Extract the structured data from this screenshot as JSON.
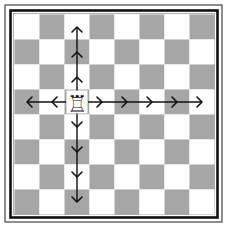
{
  "diagram": {
    "board": {
      "size": 8,
      "origin": [
        14.5,
        14.5
      ],
      "square_size": 25,
      "light_color": "#ffffff",
      "dark_color": "#a6a6a6",
      "first_square": "light"
    },
    "frame": {
      "outer_line_color": "#444444",
      "inner_line_color": "#111111"
    },
    "piece": {
      "type": "rook",
      "color": "white",
      "glyph": "♖",
      "col": 2,
      "row": 3
    },
    "moves": {
      "arrow_color": "#111111",
      "up": {
        "squares": 3
      },
      "down": {
        "squares": 4
      },
      "left": {
        "squares": 2
      },
      "right": {
        "squares": 5
      }
    }
  }
}
